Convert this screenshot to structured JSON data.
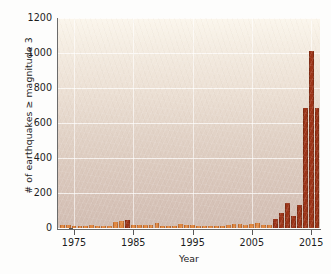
{
  "chart_data": {
    "type": "bar",
    "title": "",
    "xlabel": "Year",
    "ylabel": "# of earthquakes ≥ magnitude 3",
    "xlim": [
      1972.3,
      2016.5
    ],
    "ylim": [
      0,
      1200
    ],
    "ytick_values": [
      0,
      200,
      400,
      600,
      800,
      1000,
      1200
    ],
    "ytick_labels": [
      "0",
      "200",
      "400",
      "600",
      "800",
      "1000",
      "1200"
    ],
    "xtick_values": [
      1975,
      1985,
      1995,
      2005,
      2015
    ],
    "xtick_labels": [
      "1975",
      "1985",
      "1995",
      "2005",
      "2015"
    ],
    "grid": "horizontal and vertical white gridlines at ticks",
    "legend": "none",
    "bar_color_early": "#E0873F",
    "bar_color_late": "#9C3418",
    "bar_edge_color": "#7E2A12",
    "plot_background": "#E6D8CC",
    "categories": [
      1973,
      1974,
      1975,
      1976,
      1977,
      1978,
      1979,
      1980,
      1981,
      1982,
      1983,
      1984,
      1985,
      1986,
      1987,
      1988,
      1989,
      1990,
      1991,
      1992,
      1993,
      1994,
      1995,
      1996,
      1997,
      1998,
      1999,
      2000,
      2001,
      2002,
      2003,
      2004,
      2005,
      2006,
      2007,
      2008,
      2009,
      2010,
      2011,
      2012,
      2013,
      2014,
      2015,
      2016
    ],
    "values": [
      16,
      18,
      14,
      12,
      14,
      16,
      10,
      12,
      14,
      36,
      38,
      48,
      20,
      18,
      16,
      18,
      28,
      12,
      14,
      10,
      24,
      16,
      18,
      10,
      12,
      14,
      10,
      12,
      18,
      22,
      24,
      20,
      22,
      26,
      20,
      18,
      52,
      84,
      144,
      66,
      134,
      684,
      1010,
      686
    ],
    "series": [
      {
        "name": "# of earthquakes ≥ magnitude 3",
        "values": [
          16,
          18,
          14,
          12,
          14,
          16,
          10,
          12,
          14,
          36,
          38,
          48,
          20,
          18,
          16,
          18,
          28,
          12,
          14,
          10,
          24,
          16,
          18,
          10,
          12,
          14,
          10,
          12,
          18,
          22,
          24,
          20,
          22,
          26,
          20,
          18,
          52,
          84,
          144,
          66,
          134,
          684,
          1010,
          686
        ]
      }
    ]
  }
}
